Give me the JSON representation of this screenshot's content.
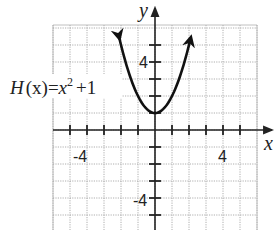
{
  "chart_data": {
    "type": "line",
    "title": "",
    "function_label": "H(x) = x² + 1",
    "label_parts": {
      "lhs": "H",
      "arg": "(x)",
      "eq": "=",
      "base": "x",
      "exp": "2",
      "rest": "+1"
    },
    "xlabel": "x",
    "ylabel": "y",
    "xlim": [
      -6,
      6
    ],
    "ylim": [
      -6,
      6
    ],
    "grid": true,
    "tick_labels": {
      "x": [
        "-4",
        "4"
      ],
      "y": [
        "4",
        "-4"
      ]
    },
    "series": [
      {
        "name": "H(x) = x^2 + 1",
        "x": [
          -2.1,
          -2,
          -1.5,
          -1,
          -0.5,
          0,
          0.5,
          1,
          1.5,
          2,
          2.1
        ],
        "y": [
          5.41,
          5,
          3.25,
          2,
          1.25,
          1,
          1.25,
          2,
          3.25,
          5,
          5.41
        ]
      }
    ],
    "vertex": [
      0,
      1
    ]
  },
  "colors": {
    "grid": "#9a9a9a",
    "axis": "#222222",
    "curve": "#111111"
  }
}
